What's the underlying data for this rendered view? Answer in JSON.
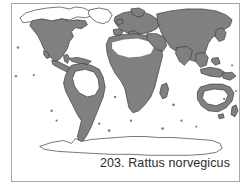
{
  "figure": {
    "number": "203.",
    "species_name": "Rattus norvegicus",
    "caption": "203. Rattus norvegicus",
    "type": "species-distribution-map"
  },
  "colors": {
    "distribution_fill": "#808080",
    "landmass_outline": "#3c3c3c",
    "unoccupied_land": "#ffffff",
    "ocean_background": "#ffffff",
    "frame_border": "#a8a8a8",
    "caption_text": "#2b2b2b"
  },
  "map": {
    "projection": "world-equirectangular",
    "frame": {
      "x": 11,
      "y": 3,
      "width": 229,
      "height": 179
    },
    "legend_note": "Shaded gray areas indicate species distribution range",
    "regions": [
      {
        "name": "north-america",
        "shaded": true
      },
      {
        "name": "arctic-canada",
        "shaded": false
      },
      {
        "name": "greenland",
        "shaded": false
      },
      {
        "name": "central-america",
        "shaded": true
      },
      {
        "name": "caribbean",
        "shaded": true
      },
      {
        "name": "south-america-coastal",
        "shaded": true
      },
      {
        "name": "amazon-basin-interior",
        "shaded": false
      },
      {
        "name": "europe",
        "shaded": true
      },
      {
        "name": "north-africa-sahara",
        "shaded": false
      },
      {
        "name": "sub-saharan-africa",
        "shaded": true
      },
      {
        "name": "madagascar",
        "shaded": true
      },
      {
        "name": "middle-east",
        "shaded": true
      },
      {
        "name": "russia-siberia",
        "shaded": true
      },
      {
        "name": "east-asia",
        "shaded": true
      },
      {
        "name": "japan",
        "shaded": true
      },
      {
        "name": "southeast-asia-islands",
        "shaded": true
      },
      {
        "name": "new-guinea",
        "shaded": true
      },
      {
        "name": "australia-coastal",
        "shaded": true
      },
      {
        "name": "australia-interior",
        "shaded": false
      },
      {
        "name": "new-zealand",
        "shaded": true
      },
      {
        "name": "antarctica",
        "shaded": false
      },
      {
        "name": "oceanic-islands",
        "shaded": true
      }
    ]
  }
}
